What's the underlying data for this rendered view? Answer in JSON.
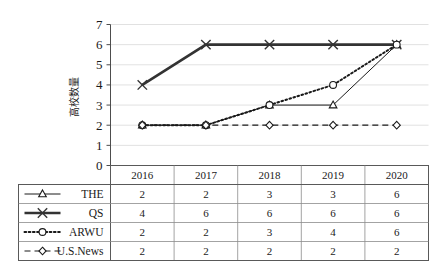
{
  "chart_data": {
    "type": "line",
    "title": "",
    "subtitle": "",
    "xlabel": "",
    "ylabel": "高校数量",
    "categories": [
      "2016",
      "2017",
      "2018",
      "2019",
      "2020"
    ],
    "ylim": [
      0,
      7
    ],
    "yticks": [
      "0",
      "1",
      "2",
      "3",
      "4",
      "5",
      "6",
      "7"
    ],
    "grid": true,
    "legend_position": "table-row-headers",
    "series": [
      {
        "name": "THE",
        "values": [
          2,
          2,
          3,
          3,
          6
        ],
        "marker": "triangle",
        "line_style": "solid",
        "line_width": 1,
        "color": "#1a1a1a"
      },
      {
        "name": "QS",
        "values": [
          4,
          6,
          6,
          6,
          6
        ],
        "marker": "x",
        "line_style": "solid",
        "line_width": 2.6,
        "color": "#333333"
      },
      {
        "name": "ARWU",
        "values": [
          2,
          2,
          3,
          4,
          6
        ],
        "marker": "circle",
        "line_style": "dotted",
        "line_width": 2,
        "color": "#1a1a1a"
      },
      {
        "name": "U.S.News",
        "values": [
          2,
          2,
          2,
          2,
          2
        ],
        "marker": "diamond",
        "line_style": "dashed",
        "line_width": 1.2,
        "color": "#1a1a1a"
      }
    ]
  },
  "data_table": {
    "header_corner_label": "",
    "columns": [
      "2016",
      "2017",
      "2018",
      "2019",
      "2020"
    ],
    "rows": [
      {
        "label": "THE",
        "values": [
          "2",
          "2",
          "3",
          "3",
          "6"
        ]
      },
      {
        "label": "QS",
        "values": [
          "4",
          "6",
          "6",
          "6",
          "6"
        ]
      },
      {
        "label": "ARWU",
        "values": [
          "2",
          "2",
          "3",
          "4",
          "6"
        ]
      },
      {
        "label": "U.S.News",
        "values": [
          "2",
          "2",
          "2",
          "2",
          "2"
        ]
      }
    ]
  }
}
